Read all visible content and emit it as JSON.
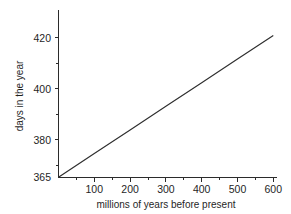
{
  "chart_data": {
    "type": "line",
    "title": "",
    "subtitle": "",
    "xlabel": "millions of years before present",
    "ylabel": "days in the year",
    "xlim": [
      0,
      620
    ],
    "ylim": [
      365,
      425
    ],
    "grid": false,
    "legend": null,
    "x_ticks": [
      100,
      200,
      300,
      400,
      500,
      600
    ],
    "x_tick_labels": [
      "100",
      "200",
      "300",
      "400",
      "500",
      "600"
    ],
    "x_minor_ticks": [
      50,
      150,
      250,
      350,
      450,
      550
    ],
    "y_ticks": [
      365,
      380,
      400,
      420
    ],
    "y_tick_labels": [
      "365",
      "380",
      "400",
      "420"
    ],
    "y_minor_ticks": [
      370,
      390,
      410
    ],
    "series": [
      {
        "name": "days in the year",
        "color": "#2e2e2e",
        "x": [
          0,
          100,
          200,
          300,
          400,
          500,
          600
        ],
        "values": [
          365.0,
          374.3,
          383.6,
          392.9,
          402.2,
          411.5,
          420.8
        ]
      }
    ],
    "annotations": []
  },
  "axis_labels": {
    "y_420": "420",
    "y_400": "400",
    "y_380": "380",
    "y_365": "365",
    "x_100": "100",
    "x_200": "200",
    "x_300": "300",
    "x_400": "400",
    "x_500": "500",
    "x_600": "600",
    "x_title": "millions of years before present",
    "y_title": "days in the year"
  },
  "colors": {
    "background": "#ffffff",
    "axis": "#2b2b2b",
    "line": "#2e2e2e",
    "text": "#1f1f1f"
  }
}
